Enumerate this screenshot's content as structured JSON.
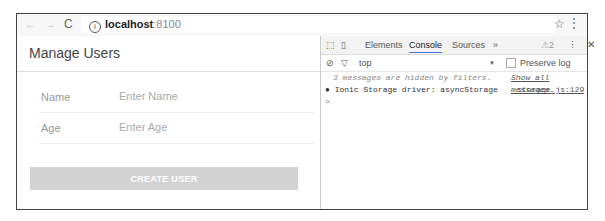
{
  "browser": {
    "back_icon": "←",
    "forward_icon": "→",
    "reload_icon": "C",
    "info_icon": "i",
    "url_host": "localhost",
    "url_port": ":8100",
    "star_icon": "☆",
    "menu_icon": "⋮"
  },
  "app": {
    "title": "Manage Users",
    "fields": [
      {
        "label": "Name",
        "placeholder": "Enter Name"
      },
      {
        "label": "Age",
        "placeholder": "Enter Age"
      }
    ],
    "create_button": "CREATE USER"
  },
  "devtools": {
    "tabs": [
      "Elements",
      "Console",
      "Sources",
      "»"
    ],
    "active_tab": "Console",
    "warning_count": "2",
    "context": "top",
    "preserve_log": "Preserve log",
    "hidden_msg": "3 messages are hidden by filters.",
    "show_all": "Show all messages.",
    "log_text": "Ionic Storage driver: asyncStorage",
    "log_source": "storage.js:129",
    "prompt": ">"
  }
}
